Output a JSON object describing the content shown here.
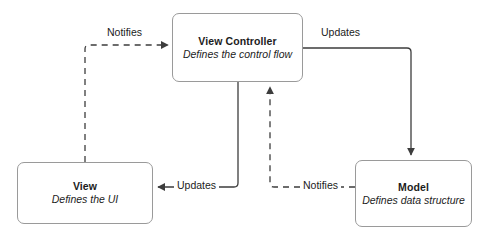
{
  "diagram": {
    "background_color": "#ffffff",
    "node_border_color": "#9a9a9a",
    "edge_color": "#3d3d3d",
    "text_color": "#1c1c1c",
    "nodes": [
      {
        "id": "view-controller",
        "title": "View Controller",
        "subtitle": "Defines the control flow"
      },
      {
        "id": "view",
        "title": "View",
        "subtitle": "Defines the UI"
      },
      {
        "id": "model",
        "title": "Model",
        "subtitle": "Defines data structure"
      }
    ],
    "edges": [
      {
        "id": "view-notifies-controller",
        "label": "Notifies",
        "from": "view",
        "to": "view-controller",
        "style": "dashed"
      },
      {
        "id": "controller-updates-model",
        "label": "Updates",
        "from": "view-controller",
        "to": "model",
        "style": "solid"
      },
      {
        "id": "controller-updates-view",
        "label": "Updates",
        "from": "view-controller",
        "to": "view",
        "style": "solid"
      },
      {
        "id": "model-notifies-controller",
        "label": "Notifies",
        "from": "model",
        "to": "view-controller",
        "style": "dashed"
      }
    ]
  }
}
